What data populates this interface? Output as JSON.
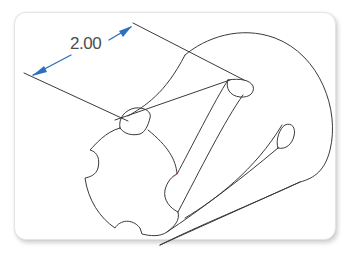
{
  "figure": {
    "type": "isometric CAD drawing",
    "dimension": {
      "label": "2.00",
      "arrow_color": "#2e6fc0"
    },
    "line_color": "#3a3a3a",
    "background": "#ffffff",
    "card_border": "#e4e4e4"
  }
}
